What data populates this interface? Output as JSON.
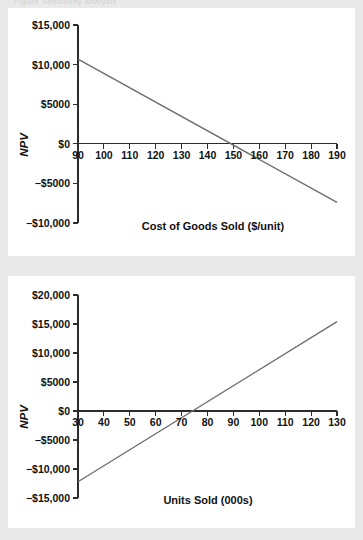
{
  "page": {
    "background_color": "#e9e9e9",
    "card_color": "#ffffff",
    "line_color": "#6e6e6e",
    "axis_color": "#2b2b2b",
    "cut_off_caption": "Figure   Sensitivity analysis"
  },
  "chart_data": [
    {
      "id": "cogs",
      "type": "line",
      "title": "Cost of Goods Sold ($/unit)",
      "xlabel": "Cost of Goods Sold ($/unit)",
      "ylabel": "NPV",
      "grid": false,
      "legend": "none",
      "xlim": [
        90,
        190
      ],
      "ylim": [
        -10000,
        15000
      ],
      "xticks": [
        90,
        100,
        110,
        120,
        130,
        140,
        150,
        160,
        170,
        180,
        190
      ],
      "xticklabels": [
        "90",
        "100",
        "110",
        "120",
        "130",
        "140",
        "150",
        "160",
        "170",
        "180",
        "190"
      ],
      "yticks": [
        15000,
        10000,
        5000,
        0,
        -5000,
        -10000
      ],
      "yticklabels": [
        "$15,000",
        "$10,000",
        "$5000",
        "$0",
        "−$5000",
        "−$10,000"
      ],
      "x": [
        90,
        190
      ],
      "values": [
        10700,
        -7400
      ],
      "zero_crossing_x": 150,
      "slope_per_unit": -181
    },
    {
      "id": "units",
      "type": "line",
      "title": "Units Sold (000s)",
      "xlabel": "Units Sold (000s)",
      "ylabel": "NPV",
      "grid": false,
      "legend": "none",
      "xlim": [
        30,
        130
      ],
      "ylim": [
        -15000,
        20000
      ],
      "xticks": [
        30,
        40,
        50,
        60,
        70,
        80,
        90,
        100,
        110,
        120,
        130
      ],
      "xticklabels": [
        "30",
        "40",
        "50",
        "60",
        "70",
        "80",
        "90",
        "100",
        "110",
        "120",
        "130"
      ],
      "yticks": [
        20000,
        15000,
        10000,
        5000,
        0,
        -5000,
        -10000,
        -15000
      ],
      "yticklabels": [
        "$20,000",
        "$15,000",
        "$10,000",
        "$5000",
        "$0",
        "−$5000",
        "−$10,000",
        "−$15,000"
      ],
      "x": [
        30,
        130
      ],
      "values": [
        -12200,
        15400
      ],
      "zero_crossing_x": 74,
      "slope_per_unit": 276
    }
  ]
}
